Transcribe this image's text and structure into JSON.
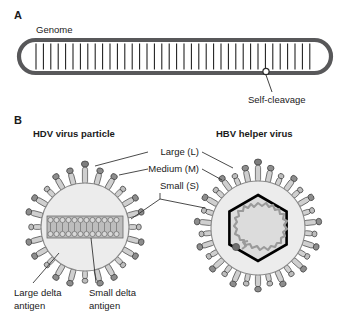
{
  "figure": {
    "panels": [
      {
        "letter": "A",
        "labels": {
          "genome": "Genome",
          "self_cleavage": "Self-cleavage"
        }
      },
      {
        "letter": "B",
        "titles": {
          "left": "HDV virus particle",
          "right": "HBV helper virus"
        },
        "envelope_protein_labels": {
          "large": "Large (L)",
          "medium": "Medium (M)",
          "small": "Small (S)"
        },
        "antigen_labels": {
          "large_line1": "Large delta",
          "large_line2": "antigen",
          "small_line1": "Small delta",
          "small_line2": "antigen"
        }
      }
    ]
  },
  "colors": {
    "background": "#ffffff",
    "text": "#1a1a1a",
    "genome_stroke": "#58585a",
    "genome_fill": "#ffffff",
    "rung": "#1a1a1a",
    "envelope_fill": "#ececec",
    "envelope_stroke": "#6e6e6e",
    "spike_body_fill": "#cfcfcf",
    "spike_body_stroke": "#4a4a4a",
    "spike_head_fill": "#8d8d8d",
    "spike_head_stroke": "#3c3c3c",
    "capsid_stroke": "#000000",
    "capsid_fill": "#dcdcdc",
    "dna_strand": "#9a9a9a",
    "polymerase_dot": "#6f6f6f",
    "rnp_fill": "#bdbdbd",
    "leader_line": "#2b2b2b"
  }
}
